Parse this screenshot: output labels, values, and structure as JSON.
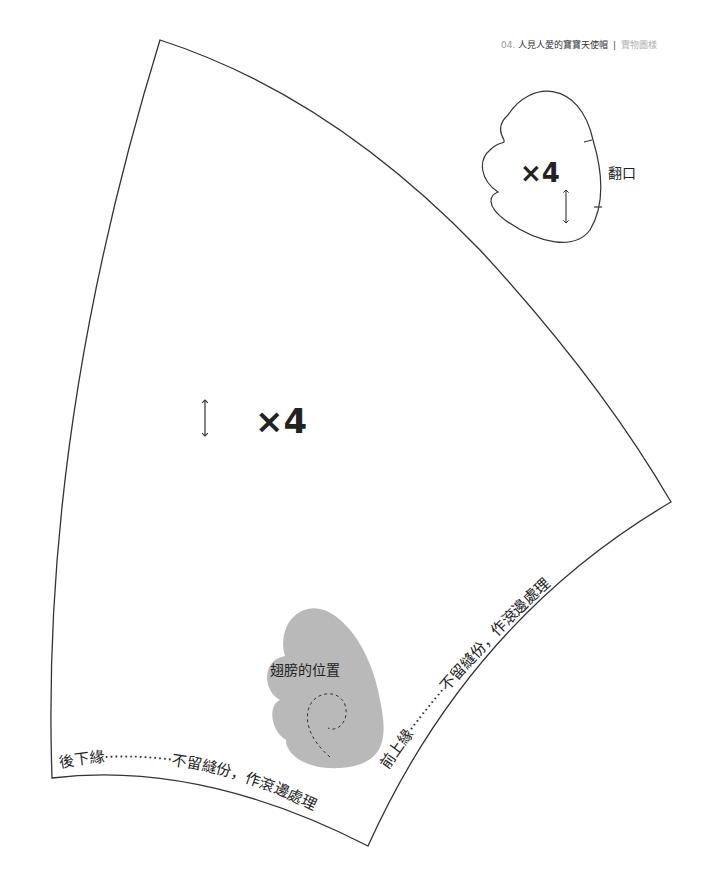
{
  "header": {
    "number": "04.",
    "title": "人見人愛的寶寶天使帽",
    "separator": "|",
    "subtitle": "實物圖樣"
  },
  "pattern": {
    "main_piece": {
      "quantity_label": "×4",
      "grain_icon": "double-arrow-vertical"
    },
    "brim_piece": {
      "quantity_label": "×4",
      "grain_icon": "double-arrow-vertical",
      "opening_label": "翻口"
    },
    "wing_position": {
      "label": "翅膀的位置",
      "fill_color": "#b9b9b9"
    },
    "edge_labels": {
      "back_lower": {
        "name": "後下緣",
        "dots": "··············",
        "note": "不留縫份，作滾邊處理"
      },
      "front_upper": {
        "name": "前上緣",
        "dots": "···········",
        "note": "不留縫份，作滾邊處理"
      }
    }
  }
}
